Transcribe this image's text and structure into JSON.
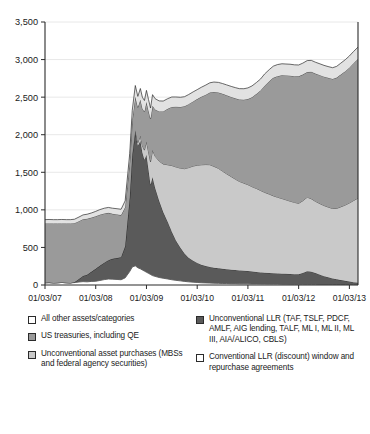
{
  "chart_data": {
    "type": "area",
    "title": "",
    "subtitle": "",
    "xlabel": "",
    "ylabel": "",
    "stacked": true,
    "grid": true,
    "legend_position": "bottom",
    "ylim": [
      0,
      3500
    ],
    "yticks": [
      0,
      500,
      1000,
      1500,
      2000,
      2500,
      3000,
      3500
    ],
    "ytick_labels": [
      "0",
      "500",
      "1,000",
      "1,500",
      "2,000",
      "2,500",
      "3,000",
      "3,500"
    ],
    "xtick_labels": [
      "01/03/07",
      "01/03/08",
      "01/03/09",
      "01/03/10",
      "01/03/11",
      "01/03/12",
      "01/03/13"
    ],
    "x": [
      2007.0,
      2007.08,
      2007.17,
      2007.25,
      2007.33,
      2007.42,
      2007.5,
      2007.58,
      2007.67,
      2007.75,
      2007.83,
      2007.92,
      2008.0,
      2008.08,
      2008.17,
      2008.25,
      2008.33,
      2008.42,
      2008.5,
      2008.58,
      2008.67,
      2008.72,
      2008.78,
      2008.83,
      2008.88,
      2008.92,
      2008.96,
      2009.0,
      2009.04,
      2009.08,
      2009.12,
      2009.17,
      2009.25,
      2009.33,
      2009.42,
      2009.5,
      2009.58,
      2009.67,
      2009.75,
      2009.83,
      2009.92,
      2010.0,
      2010.08,
      2010.17,
      2010.25,
      2010.33,
      2010.42,
      2010.5,
      2010.58,
      2010.67,
      2010.75,
      2010.83,
      2010.92,
      2011.0,
      2011.08,
      2011.17,
      2011.25,
      2011.33,
      2011.42,
      2011.5,
      2011.58,
      2011.67,
      2011.75,
      2011.83,
      2011.92,
      2012.0,
      2012.08,
      2012.17,
      2012.25,
      2012.33,
      2012.42,
      2012.5,
      2012.58,
      2012.67,
      2012.75,
      2012.83,
      2012.92,
      2013.0,
      2013.08,
      2013.17
    ],
    "series": [
      {
        "name": "Conventional LLR (discount) window and repurchase agreements",
        "key": "conventional_llr",
        "color": "#ffffff",
        "order": 1,
        "values": [
          30,
          32,
          28,
          30,
          34,
          30,
          28,
          32,
          40,
          45,
          42,
          48,
          50,
          60,
          72,
          80,
          78,
          74,
          70,
          95,
          180,
          240,
          255,
          230,
          215,
          200,
          185,
          170,
          155,
          140,
          125,
          115,
          100,
          90,
          80,
          70,
          62,
          55,
          48,
          42,
          38,
          34,
          30,
          28,
          26,
          24,
          22,
          20,
          20,
          18,
          18,
          16,
          16,
          15,
          14,
          14,
          13,
          13,
          12,
          12,
          12,
          11,
          11,
          10,
          10,
          10,
          10,
          9,
          9,
          9,
          8,
          8,
          8,
          8,
          7,
          7,
          7,
          7,
          6,
          6
        ]
      },
      {
        "name": "Unconventional LLR (TAF, TSLF, PDCF, AMLF, AIG lending, TALF, ML I, ML II, ML III, AIA/ALICO, CBLS)",
        "key": "unconventional_llr",
        "color": "#5a5a5a",
        "order": 2,
        "values": [
          0,
          0,
          0,
          0,
          0,
          0,
          0,
          5,
          40,
          75,
          95,
          130,
          165,
          195,
          225,
          250,
          270,
          285,
          300,
          420,
          980,
          1480,
          1780,
          1620,
          1700,
          1560,
          1480,
          1560,
          1380,
          1190,
          1310,
          1180,
          1020,
          880,
          760,
          640,
          530,
          440,
          370,
          320,
          285,
          260,
          240,
          225,
          215,
          205,
          200,
          195,
          190,
          185,
          182,
          178,
          175,
          170,
          165,
          160,
          155,
          150,
          148,
          145,
          142,
          140,
          138,
          136,
          134,
          132,
          150,
          175,
          168,
          150,
          130,
          110,
          95,
          80,
          68,
          58,
          48,
          40,
          32,
          25
        ]
      },
      {
        "name": "Unconventional asset purchases (MBSs and federal agency securities)",
        "key": "unconventional_asset_purchases",
        "color": "#c9c9c9",
        "order": 3,
        "values": [
          0,
          0,
          0,
          0,
          0,
          0,
          0,
          0,
          0,
          0,
          0,
          0,
          0,
          0,
          0,
          0,
          0,
          0,
          0,
          0,
          0,
          10,
          25,
          45,
          70,
          95,
          130,
          180,
          240,
          310,
          360,
          420,
          530,
          640,
          760,
          880,
          980,
          1060,
          1130,
          1200,
          1260,
          1300,
          1330,
          1350,
          1360,
          1350,
          1330,
          1300,
          1270,
          1240,
          1210,
          1185,
          1165,
          1150,
          1130,
          1110,
          1090,
          1070,
          1050,
          1030,
          1015,
          1000,
          985,
          970,
          955,
          945,
          960,
          985,
          970,
          955,
          945,
          940,
          935,
          930,
          945,
          975,
          1010,
          1045,
          1085,
          1125
        ]
      },
      {
        "name": "US treasuries, including QE",
        "key": "us_treasuries",
        "color": "#9a9a9a",
        "order": 4,
        "values": [
          790,
          788,
          792,
          790,
          786,
          790,
          792,
          786,
          770,
          755,
          745,
          720,
          700,
          680,
          655,
          630,
          600,
          580,
          560,
          520,
          480,
          460,
          445,
          470,
          480,
          495,
          510,
          525,
          545,
          570,
          590,
          620,
          660,
          700,
          745,
          780,
          800,
          815,
          830,
          845,
          860,
          880,
          905,
          930,
          960,
          990,
          1010,
          1030,
          1045,
          1060,
          1075,
          1090,
          1110,
          1140,
          1190,
          1260,
          1330,
          1420,
          1500,
          1570,
          1610,
          1640,
          1655,
          1670,
          1680,
          1690,
          1680,
          1665,
          1690,
          1700,
          1710,
          1715,
          1720,
          1725,
          1740,
          1760,
          1780,
          1800,
          1825,
          1850
        ]
      },
      {
        "name": "All other assets/categories",
        "key": "all_other_assets",
        "color": "#e2e2e2",
        "order": 5,
        "values": [
          50,
          52,
          50,
          50,
          52,
          50,
          50,
          52,
          55,
          58,
          60,
          62,
          65,
          68,
          70,
          72,
          74,
          76,
          78,
          85,
          110,
          135,
          150,
          145,
          150,
          148,
          150,
          155,
          150,
          145,
          148,
          145,
          140,
          138,
          135,
          132,
          130,
          128,
          128,
          127,
          127,
          126,
          126,
          128,
          130,
          132,
          134,
          136,
          138,
          140,
          142,
          144,
          146,
          148,
          150,
          152,
          154,
          156,
          156,
          155,
          154,
          153,
          152,
          152,
          151,
          151,
          152,
          153,
          152,
          151,
          150,
          150,
          149,
          149,
          150,
          152,
          154,
          156,
          158,
          160
        ]
      }
    ],
    "annotations": []
  },
  "legend": {
    "left_items": [
      {
        "label": "All other assets/categories",
        "swatch_color": "#ffffff",
        "series_key": "all_other_assets"
      },
      {
        "label": "US treasuries, including QE",
        "swatch_color": "#9a9a9a",
        "series_key": "us_treasuries"
      },
      {
        "label": "Unconventional asset purchases (MBSs and federal agency securities)",
        "swatch_color": "#c9c9c9",
        "series_key": "unconventional_asset_purchases"
      }
    ],
    "right_items": [
      {
        "label": "Unconventional LLR (TAF, TSLF, PDCF, AMLF, AIG lending, TALF, ML I, ML II, ML III, AIA/ALICO, CBLS)",
        "swatch_color": "#5a5a5a",
        "series_key": "unconventional_llr"
      },
      {
        "label": "Conventional LLR (discount) window and repurchase agreements",
        "swatch_color": "#ffffff",
        "series_key": "conventional_llr"
      }
    ]
  },
  "colors": {
    "axis": "#2b2b2b",
    "grid": "#e8e8e8",
    "text": "#1a1a1a",
    "background": "#ffffff"
  }
}
